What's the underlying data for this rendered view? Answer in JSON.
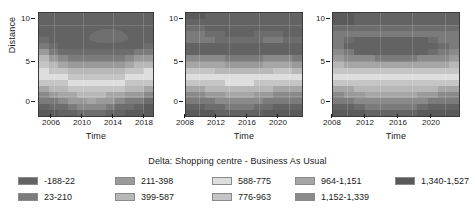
{
  "chart_data": {
    "type": "heatmap",
    "title": "Delta: Shopping centre - Business As Usual",
    "xlabel": "Time",
    "ylabel": "Distance",
    "grid": true,
    "legend_position": "bottom",
    "ylim": [
      -1,
      11
    ],
    "yticks": [
      0,
      5,
      10
    ],
    "colormap": "greyscale",
    "levels": [
      {
        "label": "-188-22",
        "color": "#636363"
      },
      {
        "label": "23-210",
        "color": "#7b7b7b"
      },
      {
        "label": "211-398",
        "color": "#9a9a9a"
      },
      {
        "label": "399-587",
        "color": "#b8b8b8"
      },
      {
        "label": "588-775",
        "color": "#dedede"
      },
      {
        "label": "776-963",
        "color": "#c5c5c5"
      },
      {
        "label": "964-1,151",
        "color": "#a6a6a6"
      },
      {
        "label": "1,152-1,339",
        "color": "#8a8a8a"
      },
      {
        "label": "1,340-1,527",
        "color": "#5a5a5a"
      }
    ],
    "legend_columns": [
      [
        {
          "label": "-188-22",
          "color": "#636363"
        },
        {
          "label": "23-210",
          "color": "#7b7b7b"
        }
      ],
      [
        {
          "label": "211-398",
          "color": "#9a9a9a"
        },
        {
          "label": "399-587",
          "color": "#b8b8b8"
        }
      ],
      [
        {
          "label": "588-775",
          "color": "#dedede"
        },
        {
          "label": "776-963",
          "color": "#c5c5c5"
        }
      ],
      [
        {
          "label": "964-1,151",
          "color": "#a6a6a6"
        },
        {
          "label": "1,152-1,339",
          "color": "#8a8a8a"
        }
      ],
      [
        {
          "label": "1,340-1,527",
          "color": "#5a5a5a"
        }
      ]
    ],
    "panels": [
      {
        "index": 1,
        "xlabel": "Time",
        "ylabel": "Distance",
        "xticks": [
          "2006",
          "2010",
          "2014",
          "2018"
        ],
        "xlim": [
          2004,
          2019
        ],
        "yticks": [
          "10",
          "5",
          "0"
        ],
        "blob": {
          "present": true,
          "x_center": 2013,
          "y_center": 8,
          "color": "#6f6f6f"
        },
        "rows": [
          [
            "#636363",
            "#636363",
            "#636363",
            "#636363",
            "#636363",
            "#636363",
            "#636363",
            "#636363",
            "#636363",
            "#636363",
            "#636363",
            "#636363"
          ],
          [
            "#636363",
            "#636363",
            "#636363",
            "#636363",
            "#636363",
            "#636363",
            "#636363",
            "#636363",
            "#636363",
            "#636363",
            "#636363",
            "#636363"
          ],
          [
            "#636363",
            "#636363",
            "#636363",
            "#636363",
            "#636363",
            "#636363",
            "#636363",
            "#636363",
            "#636363",
            "#636363",
            "#636363",
            "#636363"
          ],
          [
            "#636363",
            "#636363",
            "#636363",
            "#636363",
            "#636363",
            "#636363",
            "#636363",
            "#636363",
            "#636363",
            "#636363",
            "#636363",
            "#636363"
          ],
          [
            "#6d6d6d",
            "#636363",
            "#636363",
            "#636363",
            "#636363",
            "#636363",
            "#636363",
            "#636363",
            "#636363",
            "#636363",
            "#636363",
            "#636363"
          ],
          [
            "#7b7b7b",
            "#6d6d6d",
            "#636363",
            "#636363",
            "#636363",
            "#636363",
            "#636363",
            "#636363",
            "#636363",
            "#636363",
            "#636363",
            "#6d6d6d"
          ],
          [
            "#9a9a9a",
            "#7b7b7b",
            "#6d6d6d",
            "#6d6d6d",
            "#6d6d6d",
            "#6d6d6d",
            "#6d6d6d",
            "#6d6d6d",
            "#6d6d6d",
            "#6d6d6d",
            "#7b7b7b",
            "#7b7b7b"
          ],
          [
            "#b8b8b8",
            "#9a9a9a",
            "#8a8a8a",
            "#7b7b7b",
            "#7b7b7b",
            "#7b7b7b",
            "#7b7b7b",
            "#7b7b7b",
            "#7b7b7b",
            "#8a8a8a",
            "#9a9a9a",
            "#9a9a9a"
          ],
          [
            "#c5c5c5",
            "#b8b8b8",
            "#a6a6a6",
            "#9a9a9a",
            "#9a9a9a",
            "#9a9a9a",
            "#9a9a9a",
            "#9a9a9a",
            "#9a9a9a",
            "#a6a6a6",
            "#b8b8b8",
            "#b8b8b8"
          ],
          [
            "#dedede",
            "#c5c5c5",
            "#c5c5c5",
            "#b8b8b8",
            "#b8b8b8",
            "#b8b8b8",
            "#b8b8b8",
            "#b8b8b8",
            "#b8b8b8",
            "#c5c5c5",
            "#c5c5c5",
            "#dedede"
          ],
          [
            "#dedede",
            "#dedede",
            "#dedede",
            "#c5c5c5",
            "#c5c5c5",
            "#c5c5c5",
            "#c5c5c5",
            "#c5c5c5",
            "#c5c5c5",
            "#dedede",
            "#dedede",
            "#dedede"
          ],
          [
            "#c5c5c5",
            "#c5c5c5",
            "#c5c5c5",
            "#dedede",
            "#dedede",
            "#dedede",
            "#dedede",
            "#dedede",
            "#dedede",
            "#c5c5c5",
            "#c5c5c5",
            "#c5c5c5"
          ],
          [
            "#a6a6a6",
            "#b8b8b8",
            "#b8b8b8",
            "#c5c5c5",
            "#c5c5c5",
            "#c5c5c5",
            "#c5c5c5",
            "#c5c5c5",
            "#c5c5c5",
            "#b8b8b8",
            "#b8b8b8",
            "#a6a6a6"
          ],
          [
            "#8a8a8a",
            "#9a9a9a",
            "#a6a6a6",
            "#a6a6a6",
            "#b8b8b8",
            "#b8b8b8",
            "#b8b8b8",
            "#a6a6a6",
            "#a6a6a6",
            "#9a9a9a",
            "#9a9a9a",
            "#8a8a8a"
          ],
          [
            "#7b7b7b",
            "#7b7b7b",
            "#8a8a8a",
            "#9a9a9a",
            "#9a9a9a",
            "#a6a6a6",
            "#9a9a9a",
            "#9a9a9a",
            "#8a8a8a",
            "#7b7b7b",
            "#7b7b7b",
            "#6d6d6d"
          ],
          [
            "#636363",
            "#6d6d6d",
            "#6d6d6d",
            "#7b7b7b",
            "#8a8a8a",
            "#8a8a8a",
            "#8a8a8a",
            "#7b7b7b",
            "#6d6d6d",
            "#6d6d6d",
            "#636363",
            "#5a5a5a"
          ],
          [
            "#5a5a5a",
            "#5a5a5a",
            "#636363",
            "#636363",
            "#6d6d6d",
            "#6d6d6d",
            "#6d6d6d",
            "#636363",
            "#636363",
            "#5a5a5a",
            "#5a5a5a",
            "#5a5a5a"
          ]
        ]
      },
      {
        "index": 2,
        "xlabel": "Time",
        "ylabel": "",
        "xticks": [
          "2008",
          "2012",
          "2016",
          "2020"
        ],
        "xlim": [
          2006,
          2021
        ],
        "yticks": [
          "10",
          "5",
          "0"
        ],
        "blob": {
          "present": false
        },
        "rows": [
          [
            "#5a5a5a",
            "#5a5a5a",
            "#636363",
            "#636363",
            "#636363",
            "#636363",
            "#636363",
            "#636363",
            "#636363",
            "#636363",
            "#636363",
            "#636363"
          ],
          [
            "#636363",
            "#636363",
            "#636363",
            "#636363",
            "#636363",
            "#636363",
            "#636363",
            "#636363",
            "#636363",
            "#636363",
            "#636363",
            "#636363"
          ],
          [
            "#6d6d6d",
            "#6d6d6d",
            "#636363",
            "#636363",
            "#636363",
            "#636363",
            "#636363",
            "#636363",
            "#636363",
            "#636363",
            "#636363",
            "#636363"
          ],
          [
            "#7b7b7b",
            "#7b7b7b",
            "#6d6d6d",
            "#6d6d6d",
            "#636363",
            "#636363",
            "#636363",
            "#6d6d6d",
            "#6d6d6d",
            "#6d6d6d",
            "#636363",
            "#636363"
          ],
          [
            "#7b7b7b",
            "#7b7b7b",
            "#7b7b7b",
            "#6d6d6d",
            "#6d6d6d",
            "#6d6d6d",
            "#6d6d6d",
            "#6d6d6d",
            "#7b7b7b",
            "#7b7b7b",
            "#6d6d6d",
            "#6d6d6d"
          ],
          [
            "#636363",
            "#636363",
            "#636363",
            "#636363",
            "#636363",
            "#636363",
            "#636363",
            "#636363",
            "#636363",
            "#636363",
            "#636363",
            "#636363"
          ],
          [
            "#636363",
            "#636363",
            "#636363",
            "#636363",
            "#636363",
            "#636363",
            "#636363",
            "#636363",
            "#636363",
            "#636363",
            "#636363",
            "#636363"
          ],
          [
            "#8a8a8a",
            "#8a8a8a",
            "#8a8a8a",
            "#8a8a8a",
            "#7b7b7b",
            "#7b7b7b",
            "#7b7b7b",
            "#7b7b7b",
            "#8a8a8a",
            "#8a8a8a",
            "#8a8a8a",
            "#7b7b7b"
          ],
          [
            "#a6a6a6",
            "#a6a6a6",
            "#a6a6a6",
            "#a6a6a6",
            "#9a9a9a",
            "#9a9a9a",
            "#9a9a9a",
            "#9a9a9a",
            "#a6a6a6",
            "#a6a6a6",
            "#a6a6a6",
            "#9a9a9a"
          ],
          [
            "#c5c5c5",
            "#c5c5c5",
            "#c5c5c5",
            "#b8b8b8",
            "#b8b8b8",
            "#b8b8b8",
            "#b8b8b8",
            "#b8b8b8",
            "#b8b8b8",
            "#c5c5c5",
            "#c5c5c5",
            "#b8b8b8"
          ],
          [
            "#dedede",
            "#dedede",
            "#dedede",
            "#dedede",
            "#dedede",
            "#dedede",
            "#dedede",
            "#dedede",
            "#dedede",
            "#dedede",
            "#dedede",
            "#dedede"
          ],
          [
            "#c5c5c5",
            "#c5c5c5",
            "#c5c5c5",
            "#c5c5c5",
            "#dedede",
            "#dedede",
            "#dedede",
            "#c5c5c5",
            "#c5c5c5",
            "#c5c5c5",
            "#c5c5c5",
            "#c5c5c5"
          ],
          [
            "#a6a6a6",
            "#a6a6a6",
            "#b8b8b8",
            "#b8b8b8",
            "#b8b8b8",
            "#b8b8b8",
            "#b8b8b8",
            "#b8b8b8",
            "#b8b8b8",
            "#a6a6a6",
            "#a6a6a6",
            "#a6a6a6"
          ],
          [
            "#8a8a8a",
            "#8a8a8a",
            "#9a9a9a",
            "#9a9a9a",
            "#a6a6a6",
            "#a6a6a6",
            "#a6a6a6",
            "#9a9a9a",
            "#9a9a9a",
            "#8a8a8a",
            "#8a8a8a",
            "#8a8a8a"
          ],
          [
            "#7b7b7b",
            "#7b7b7b",
            "#7b7b7b",
            "#8a8a8a",
            "#8a8a8a",
            "#8a8a8a",
            "#8a8a8a",
            "#8a8a8a",
            "#7b7b7b",
            "#7b7b7b",
            "#7b7b7b",
            "#7b7b7b"
          ],
          [
            "#636363",
            "#636363",
            "#6d6d6d",
            "#6d6d6d",
            "#7b7b7b",
            "#7b7b7b",
            "#7b7b7b",
            "#6d6d6d",
            "#6d6d6d",
            "#636363",
            "#636363",
            "#636363"
          ],
          [
            "#5a5a5a",
            "#5a5a5a",
            "#5a5a5a",
            "#636363",
            "#636363",
            "#636363",
            "#636363",
            "#636363",
            "#5a5a5a",
            "#5a5a5a",
            "#5a5a5a",
            "#5a5a5a"
          ]
        ]
      },
      {
        "index": 3,
        "xlabel": "Time",
        "ylabel": "",
        "xticks": [
          "2008",
          "2012",
          "2016",
          "2020"
        ],
        "xlim": [
          2006,
          2021
        ],
        "yticks": [
          "10",
          "5",
          "0"
        ],
        "blob": {
          "present": false
        },
        "rows": [
          [
            "#5a5a5a",
            "#5a5a5a",
            "#636363",
            "#636363",
            "#636363",
            "#636363",
            "#636363",
            "#636363",
            "#636363",
            "#636363",
            "#636363",
            "#636363"
          ],
          [
            "#5a5a5a",
            "#5a5a5a",
            "#636363",
            "#636363",
            "#636363",
            "#636363",
            "#636363",
            "#636363",
            "#636363",
            "#636363",
            "#636363",
            "#636363"
          ],
          [
            "#6d6d6d",
            "#6d6d6d",
            "#6d6d6d",
            "#6d6d6d",
            "#6d6d6d",
            "#6d6d6d",
            "#6d6d6d",
            "#6d6d6d",
            "#6d6d6d",
            "#6d6d6d",
            "#6d6d6d",
            "#6d6d6d"
          ],
          [
            "#7b7b7b",
            "#7b7b7b",
            "#7b7b7b",
            "#7b7b7b",
            "#7b7b7b",
            "#7b7b7b",
            "#7b7b7b",
            "#7b7b7b",
            "#7b7b7b",
            "#7b7b7b",
            "#7b7b7b",
            "#7b7b7b"
          ],
          [
            "#7b7b7b",
            "#6d6d6d",
            "#636363",
            "#636363",
            "#636363",
            "#636363",
            "#636363",
            "#636363",
            "#636363",
            "#6d6d6d",
            "#7b7b7b",
            "#7b7b7b"
          ],
          [
            "#7b7b7b",
            "#636363",
            "#636363",
            "#636363",
            "#636363",
            "#636363",
            "#636363",
            "#636363",
            "#636363",
            "#636363",
            "#6d6d6d",
            "#7b7b7b"
          ],
          [
            "#8a8a8a",
            "#7b7b7b",
            "#636363",
            "#636363",
            "#636363",
            "#636363",
            "#636363",
            "#636363",
            "#636363",
            "#6d6d6d",
            "#7b7b7b",
            "#8a8a8a"
          ],
          [
            "#9a9a9a",
            "#8a8a8a",
            "#8a8a8a",
            "#8a8a8a",
            "#7b7b7b",
            "#7b7b7b",
            "#7b7b7b",
            "#7b7b7b",
            "#8a8a8a",
            "#8a8a8a",
            "#8a8a8a",
            "#9a9a9a"
          ],
          [
            "#b8b8b8",
            "#a6a6a6",
            "#a6a6a6",
            "#a6a6a6",
            "#a6a6a6",
            "#a6a6a6",
            "#a6a6a6",
            "#a6a6a6",
            "#a6a6a6",
            "#a6a6a6",
            "#a6a6a6",
            "#b8b8b8"
          ],
          [
            "#c5c5c5",
            "#c5c5c5",
            "#c5c5c5",
            "#c5c5c5",
            "#c5c5c5",
            "#c5c5c5",
            "#c5c5c5",
            "#c5c5c5",
            "#c5c5c5",
            "#c5c5c5",
            "#c5c5c5",
            "#c5c5c5"
          ],
          [
            "#dedede",
            "#dedede",
            "#dedede",
            "#dedede",
            "#dedede",
            "#dedede",
            "#dedede",
            "#dedede",
            "#dedede",
            "#dedede",
            "#dedede",
            "#dedede"
          ],
          [
            "#c5c5c5",
            "#c5c5c5",
            "#c5c5c5",
            "#c5c5c5",
            "#c5c5c5",
            "#c5c5c5",
            "#c5c5c5",
            "#c5c5c5",
            "#c5c5c5",
            "#c5c5c5",
            "#c5c5c5",
            "#c5c5c5"
          ],
          [
            "#a6a6a6",
            "#a6a6a6",
            "#b8b8b8",
            "#b8b8b8",
            "#b8b8b8",
            "#b8b8b8",
            "#b8b8b8",
            "#b8b8b8",
            "#b8b8b8",
            "#b8b8b8",
            "#a6a6a6",
            "#a6a6a6"
          ],
          [
            "#8a8a8a",
            "#9a9a9a",
            "#9a9a9a",
            "#a6a6a6",
            "#a6a6a6",
            "#a6a6a6",
            "#a6a6a6",
            "#a6a6a6",
            "#9a9a9a",
            "#9a9a9a",
            "#8a8a8a",
            "#8a8a8a"
          ],
          [
            "#7b7b7b",
            "#7b7b7b",
            "#8a8a8a",
            "#8a8a8a",
            "#8a8a8a",
            "#8a8a8a",
            "#8a8a8a",
            "#8a8a8a",
            "#8a8a8a",
            "#7b7b7b",
            "#7b7b7b",
            "#7b7b7b"
          ],
          [
            "#636363",
            "#636363",
            "#6d6d6d",
            "#7b7b7b",
            "#7b7b7b",
            "#7b7b7b",
            "#7b7b7b",
            "#7b7b7b",
            "#6d6d6d",
            "#636363",
            "#636363",
            "#636363"
          ],
          [
            "#5a5a5a",
            "#5a5a5a",
            "#5a5a5a",
            "#636363",
            "#636363",
            "#636363",
            "#636363",
            "#636363",
            "#5a5a5a",
            "#5a5a5a",
            "#5a5a5a",
            "#5a5a5a"
          ]
        ]
      }
    ]
  }
}
